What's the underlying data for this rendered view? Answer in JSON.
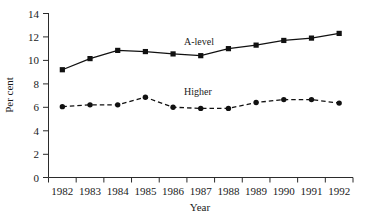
{
  "chart_data": {
    "type": "line",
    "title": "",
    "xlabel": "Year",
    "ylabel": "Per cent",
    "categories": [
      "1982",
      "1983",
      "1984",
      "1985",
      "1986",
      "1987",
      "1988",
      "1989",
      "1990",
      "1991",
      "1992"
    ],
    "x": [
      1982,
      1983,
      1984,
      1985,
      1986,
      1987,
      1988,
      1989,
      1990,
      1991,
      1992
    ],
    "ylim": [
      0,
      14
    ],
    "yticks": [
      0,
      2,
      4,
      6,
      8,
      10,
      12,
      14
    ],
    "ytick_labels": [
      "0",
      "2",
      "4",
      "6",
      "8",
      "10",
      "12",
      "14"
    ],
    "grid": false,
    "legend": "inline-annotations",
    "series": [
      {
        "name": "A-level",
        "marker": "square",
        "linestyle": "solid",
        "color": "#111111",
        "values": [
          9.2,
          10.15,
          10.85,
          10.75,
          10.55,
          10.4,
          11.0,
          11.3,
          11.7,
          11.9,
          12.3
        ]
      },
      {
        "name": "Higher",
        "marker": "circle",
        "linestyle": "dashed",
        "color": "#111111",
        "values": [
          6.05,
          6.2,
          6.2,
          6.85,
          6.0,
          5.9,
          5.9,
          6.4,
          6.65,
          6.65,
          6.35
        ]
      }
    ],
    "annotations": [
      {
        "text": "A-level",
        "series": "A-level"
      },
      {
        "text": "Higher",
        "series": "Higher"
      }
    ]
  },
  "axis": {
    "y_title": "Per cent",
    "x_title": "Year"
  }
}
